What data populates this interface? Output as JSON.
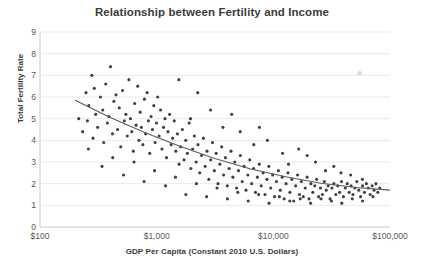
{
  "chart_data": {
    "type": "scatter",
    "title": "Relationship between Fertility and Income",
    "xlabel": "GDP Per Capita (Constant 2010 U.S. Dollars)",
    "ylabel": "Total Fertility Rate",
    "xscale": "log",
    "yscale": "linear",
    "xlim": [
      100,
      100000
    ],
    "ylim": [
      0,
      9
    ],
    "grid": true,
    "legend": "none",
    "x_tick_labels": [
      "$100",
      "$1,000",
      "$10,000",
      "$100,000"
    ],
    "x_tick_values": [
      100,
      1000,
      10000,
      100000
    ],
    "y_tick_labels": [
      "0",
      "1",
      "2",
      "3",
      "4",
      "5",
      "6",
      "7",
      "8",
      "9"
    ],
    "y_tick_values": [
      0,
      1,
      2,
      3,
      4,
      5,
      6,
      7,
      8,
      9
    ],
    "series": [
      {
        "name": "Countries",
        "marker": "circle",
        "color": "#3f3f46",
        "points": [
          [
            215,
            5.0
          ],
          [
            232,
            4.4
          ],
          [
            248,
            6.2
          ],
          [
            255,
            4.9
          ],
          [
            262,
            5.6
          ],
          [
            278,
            7.0
          ],
          [
            285,
            4.1
          ],
          [
            292,
            6.4
          ],
          [
            300,
            5.2
          ],
          [
            312,
            4.6
          ],
          [
            330,
            6.0
          ],
          [
            345,
            5.4
          ],
          [
            352,
            3.9
          ],
          [
            366,
            6.6
          ],
          [
            378,
            4.8
          ],
          [
            390,
            5.1
          ],
          [
            402,
            7.4
          ],
          [
            418,
            4.3
          ],
          [
            430,
            5.8
          ],
          [
            448,
            6.1
          ],
          [
            462,
            4.5
          ],
          [
            478,
            5.5
          ],
          [
            492,
            3.7
          ],
          [
            510,
            6.3
          ],
          [
            528,
            4.9
          ],
          [
            545,
            5.2
          ],
          [
            560,
            4.2
          ],
          [
            578,
            6.8
          ],
          [
            596,
            5.0
          ],
          [
            612,
            4.4
          ],
          [
            630,
            3.5
          ],
          [
            648,
            5.7
          ],
          [
            666,
            4.7
          ],
          [
            688,
            6.5
          ],
          [
            705,
            4.0
          ],
          [
            722,
            5.3
          ],
          [
            740,
            4.6
          ],
          [
            762,
            3.8
          ],
          [
            785,
            5.9
          ],
          [
            805,
            4.3
          ],
          [
            828,
            6.2
          ],
          [
            850,
            4.9
          ],
          [
            872,
            3.4
          ],
          [
            896,
            5.1
          ],
          [
            920,
            4.5
          ],
          [
            945,
            5.6
          ],
          [
            970,
            3.9
          ],
          [
            996,
            4.8
          ],
          [
            1020,
            6.0
          ],
          [
            1050,
            4.2
          ],
          [
            1080,
            5.4
          ],
          [
            1110,
            3.6
          ],
          [
            1145,
            4.6
          ],
          [
            1180,
            5.0
          ],
          [
            1215,
            3.2
          ],
          [
            1250,
            4.4
          ],
          [
            1290,
            5.2
          ],
          [
            1330,
            3.8
          ],
          [
            1370,
            4.1
          ],
          [
            1415,
            4.9
          ],
          [
            1460,
            3.5
          ],
          [
            1505,
            4.3
          ],
          [
            1555,
            2.9
          ],
          [
            1605,
            3.7
          ],
          [
            1660,
            4.5
          ],
          [
            1715,
            3.1
          ],
          [
            1775,
            4.0
          ],
          [
            1835,
            3.4
          ],
          [
            1900,
            4.8
          ],
          [
            1965,
            2.7
          ],
          [
            2035,
            3.6
          ],
          [
            2105,
            4.2
          ],
          [
            2180,
            3.0
          ],
          [
            2260,
            3.8
          ],
          [
            2340,
            2.5
          ],
          [
            2425,
            3.3
          ],
          [
            2515,
            4.1
          ],
          [
            2605,
            2.8
          ],
          [
            2700,
            3.5
          ],
          [
            2800,
            2.2
          ],
          [
            2905,
            3.1
          ],
          [
            3010,
            3.9
          ],
          [
            3120,
            2.6
          ],
          [
            3235,
            3.4
          ],
          [
            3355,
            2.0
          ],
          [
            3480,
            2.9
          ],
          [
            3610,
            3.7
          ],
          [
            3745,
            2.4
          ],
          [
            3885,
            3.2
          ],
          [
            4030,
            1.9
          ],
          [
            4180,
            2.7
          ],
          [
            4335,
            3.5
          ],
          [
            4500,
            2.3
          ],
          [
            4670,
            3.0
          ],
          [
            4845,
            1.8
          ],
          [
            5025,
            2.6
          ],
          [
            5215,
            3.3
          ],
          [
            5410,
            2.1
          ],
          [
            5615,
            2.8
          ],
          [
            5830,
            1.7
          ],
          [
            6050,
            2.4
          ],
          [
            6280,
            3.1
          ],
          [
            6520,
            2.0
          ],
          [
            6770,
            2.7
          ],
          [
            7030,
            1.6
          ],
          [
            7300,
            2.3
          ],
          [
            7580,
            2.9
          ],
          [
            7870,
            1.9
          ],
          [
            8170,
            2.5
          ],
          [
            8485,
            1.5
          ],
          [
            8810,
            2.2
          ],
          [
            9150,
            2.8
          ],
          [
            9500,
            1.8
          ],
          [
            9865,
            2.4
          ],
          [
            10245,
            1.4
          ],
          [
            10640,
            2.1
          ],
          [
            11050,
            2.6
          ],
          [
            11475,
            1.7
          ],
          [
            11920,
            2.3
          ],
          [
            12380,
            1.3
          ],
          [
            12855,
            2.0
          ],
          [
            13350,
            2.5
          ],
          [
            13865,
            1.6
          ],
          [
            14400,
            2.2
          ],
          [
            14955,
            1.2
          ],
          [
            15530,
            1.9
          ],
          [
            16125,
            2.4
          ],
          [
            16745,
            1.5
          ],
          [
            17390,
            2.1
          ],
          [
            18060,
            1.4
          ],
          [
            18755,
            1.8
          ],
          [
            19475,
            2.3
          ],
          [
            20225,
            1.3
          ],
          [
            21000,
            2.0
          ],
          [
            21810,
            1.6
          ],
          [
            22650,
            1.9
          ],
          [
            23520,
            2.2
          ],
          [
            24425,
            1.4
          ],
          [
            25365,
            1.8
          ],
          [
            26340,
            1.5
          ],
          [
            27355,
            2.1
          ],
          [
            28405,
            1.7
          ],
          [
            29500,
            1.9
          ],
          [
            30630,
            1.3
          ],
          [
            31810,
            1.8
          ],
          [
            33030,
            2.0
          ],
          [
            34300,
            1.5
          ],
          [
            35620,
            1.9
          ],
          [
            36990,
            1.6
          ],
          [
            38410,
            2.1
          ],
          [
            39890,
            1.4
          ],
          [
            41420,
            1.8
          ],
          [
            43010,
            2.0
          ],
          [
            44665,
            1.6
          ],
          [
            46380,
            1.9
          ],
          [
            48165,
            1.5
          ],
          [
            50015,
            1.8
          ],
          [
            51940,
            2.1
          ],
          [
            53935,
            1.7
          ],
          [
            56010,
            1.4
          ],
          [
            58165,
            1.9
          ],
          [
            60400,
            1.6
          ],
          [
            62730,
            2.0
          ],
          [
            65140,
            1.8
          ],
          [
            67650,
            1.5
          ],
          [
            70250,
            1.9
          ],
          [
            72950,
            1.7
          ],
          [
            75760,
            2.0
          ],
          [
            78680,
            1.6
          ],
          [
            81710,
            1.8
          ],
          [
            260,
            3.6
          ],
          [
            340,
            2.8
          ],
          [
            420,
            3.2
          ],
          [
            520,
            2.4
          ],
          [
            640,
            3.0
          ],
          [
            780,
            2.1
          ],
          [
            960,
            2.6
          ],
          [
            1190,
            1.9
          ],
          [
            1450,
            2.3
          ],
          [
            1780,
            1.5
          ],
          [
            2190,
            2.0
          ],
          [
            2680,
            1.4
          ],
          [
            3290,
            1.8
          ],
          [
            4040,
            1.3
          ],
          [
            4960,
            1.6
          ],
          [
            6090,
            1.2
          ],
          [
            7480,
            1.5
          ],
          [
            9180,
            1.1
          ],
          [
            11270,
            1.4
          ],
          [
            13840,
            1.2
          ],
          [
            17000,
            1.3
          ],
          [
            20870,
            1.1
          ],
          [
            25620,
            1.3
          ],
          [
            31460,
            1.2
          ],
          [
            38620,
            1.1
          ],
          [
            47420,
            1.3
          ],
          [
            58230,
            1.2
          ],
          [
            71490,
            1.4
          ],
          [
            2250,
            6.2
          ],
          [
            2900,
            5.4
          ],
          [
            3700,
            4.6
          ],
          [
            1550,
            6.8
          ],
          [
            1950,
            5.0
          ],
          [
            5200,
            4.4
          ],
          [
            6800,
            3.8
          ],
          [
            8900,
            4.0
          ],
          [
            12000,
            3.4
          ],
          [
            16500,
            3.6
          ],
          [
            23000,
            3.0
          ],
          [
            33000,
            2.8
          ],
          [
            4400,
            5.2
          ],
          [
            7600,
            4.6
          ],
          [
            13500,
            2.9
          ],
          [
            28000,
            2.6
          ],
          [
            46000,
            2.4
          ],
          [
            19500,
            3.3
          ],
          [
            38000,
            2.5
          ],
          [
            58000,
            2.2
          ]
        ]
      },
      {
        "name": "Outlier",
        "marker": "circle-faint",
        "color": "#d8d8dd",
        "points": [
          [
            55000,
            7.1
          ]
        ]
      }
    ],
    "trendline": {
      "type": "logarithmic-fit",
      "color": "#5a5a63",
      "points": [
        [
          200,
          5.85
        ],
        [
          400,
          5.05
        ],
        [
          800,
          4.35
        ],
        [
          1600,
          3.72
        ],
        [
          3200,
          3.15
        ],
        [
          6400,
          2.68
        ],
        [
          12800,
          2.32
        ],
        [
          25600,
          2.02
        ],
        [
          51200,
          1.82
        ],
        [
          100000,
          1.7
        ]
      ]
    }
  }
}
